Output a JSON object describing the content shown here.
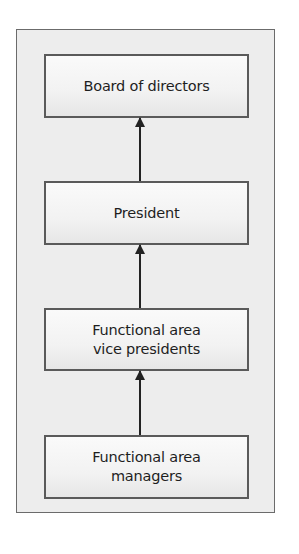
{
  "diagram": {
    "type": "hierarchy",
    "direction": "bottom-to-top",
    "nodes": [
      {
        "id": "board",
        "label": "Board of directors"
      },
      {
        "id": "president",
        "label": "President"
      },
      {
        "id": "vps",
        "label": "Functional area\nvice presidents"
      },
      {
        "id": "managers",
        "label": "Functional area\nmanagers"
      }
    ],
    "edges": [
      {
        "from": "president",
        "to": "board"
      },
      {
        "from": "vps",
        "to": "president"
      },
      {
        "from": "managers",
        "to": "vps"
      }
    ],
    "colors": {
      "frame_fill": "#ededed",
      "frame_border": "#6b6b6b",
      "node_border": "#5a5a5a",
      "arrow": "#222222",
      "text": "#1e1e1e"
    }
  }
}
